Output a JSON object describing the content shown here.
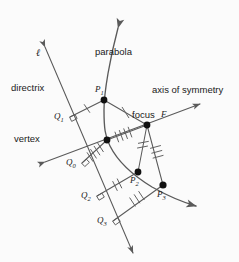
{
  "figure": {
    "background_color": "#fbfbfb",
    "stroke_color": "#4a4a4a",
    "text_color": "#1a1a1a",
    "width": 239,
    "height": 262
  },
  "labels": {
    "directrix": "directrix",
    "line_l": "ℓ",
    "parabola": "parabola",
    "axis_of_symmetry": "axis of symmetry",
    "focus": "focus",
    "focus_letter": "F",
    "vertex": "vertex",
    "p1": "P",
    "p1_sub": "1",
    "p2": "P",
    "p2_sub": "2",
    "p3": "P",
    "p3_sub": "3",
    "q0": "Q",
    "q0_sub": "0",
    "q1": "Q",
    "q1_sub": "1",
    "q2": "Q",
    "q2_sub": "2",
    "q3": "Q",
    "q3_sub": "3"
  },
  "geometry": {
    "points": {
      "focus": [
        147,
        125
      ],
      "vertex": [
        107,
        140
      ],
      "P1": [
        104,
        100
      ],
      "P2": [
        138,
        172
      ],
      "P3": [
        163,
        185
      ],
      "Q0": [
        82,
        163
      ],
      "Q1": [
        70,
        117
      ],
      "Q2": [
        97,
        196
      ],
      "Q3": [
        113,
        221
      ]
    },
    "tick_counts": {
      "Q1_to_P1": 1,
      "P1_to_focus": 1,
      "Q0_to_vertex": 4,
      "vertex_to_focus": 4,
      "Q2_to_P2": 2,
      "P2_to_focus": 2,
      "Q3_to_P3": 3,
      "P3_to_focus": 3
    },
    "right_angle_markers": [
      "Q0",
      "Q1",
      "Q2",
      "Q3"
    ],
    "arrows": {
      "directrix": "both-ends",
      "axis_of_symmetry": "both-ends",
      "parabola": "both-ends"
    }
  }
}
